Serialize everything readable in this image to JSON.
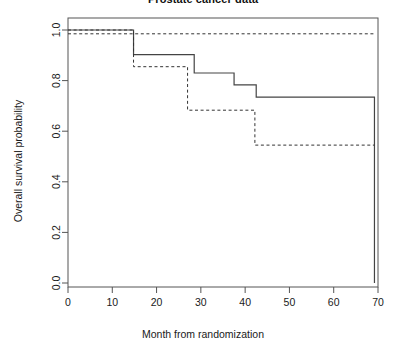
{
  "chart_data": {
    "type": "line",
    "title": "Prostate cancer data",
    "xlabel": "Month from randomization",
    "ylabel": "Overall survival probability",
    "xlim": [
      0,
      70
    ],
    "ylim": [
      0.0,
      1.0
    ],
    "xticks": [
      0,
      10,
      20,
      30,
      40,
      50,
      60,
      70
    ],
    "xtick_labels": [
      "0",
      "10",
      "20",
      "30",
      "40",
      "50",
      "60",
      "70"
    ],
    "yticks": [
      0.0,
      0.2,
      0.4,
      0.6,
      0.8,
      1.0
    ],
    "ytick_labels": [
      "0.0",
      "0.2",
      "0.4",
      "0.6",
      "0.8",
      "1.0"
    ],
    "grid": false,
    "legend": "none",
    "step_type": "post",
    "series": [
      {
        "name": "upper-dashed-curve",
        "style": "dashed",
        "color": "#333333",
        "x": [
          0,
          14.8,
          69.5
        ],
        "y": [
          0.985,
          0.985,
          0.985
        ]
      },
      {
        "name": "solid-curve",
        "style": "solid",
        "color": "#444444",
        "x": [
          0,
          14.8,
          14.8,
          28.5,
          28.5,
          37.5,
          37.5,
          42.5,
          42.5,
          69.2,
          69.2
        ],
        "y": [
          1.0,
          1.0,
          0.903,
          0.903,
          0.83,
          0.83,
          0.783,
          0.783,
          0.735,
          0.735,
          0.0
        ]
      },
      {
        "name": "lower-dashed-curve",
        "style": "dashed",
        "color": "#333333",
        "x": [
          0,
          14.8,
          14.8,
          27.0,
          27.0,
          42.2,
          42.2,
          69.2
        ],
        "y": [
          1.0,
          1.0,
          0.855,
          0.855,
          0.683,
          0.683,
          0.545,
          0.545
        ]
      }
    ]
  },
  "plot_area": {
    "left_px": 68,
    "right_px": 378,
    "top_px": 18,
    "bottom_px": 287
  }
}
